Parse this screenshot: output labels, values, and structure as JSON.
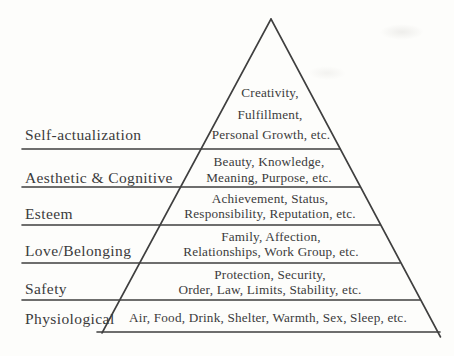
{
  "diagram": {
    "name": "Maslow hierarchy of needs pyramid",
    "ink_color": "#3b3b3b",
    "background_color": "#fdfdfb",
    "levels": [
      {
        "label": "Self-actualization",
        "lines": [
          "Creativity,",
          "Fulfillment,",
          "Personal Growth, etc."
        ]
      },
      {
        "label": "Aesthetic & Cognitive",
        "lines": [
          "Beauty, Knowledge,",
          "Meaning, Purpose, etc."
        ]
      },
      {
        "label": "Esteem",
        "lines": [
          "Achievement, Status,",
          "Responsibility, Reputation, etc."
        ]
      },
      {
        "label": "Love/Belonging",
        "lines": [
          "Family, Affection,",
          "Relationships, Work Group, etc."
        ]
      },
      {
        "label": "Safety",
        "lines": [
          "Protection, Security,",
          "Order, Law, Limits, Stability, etc."
        ]
      },
      {
        "label": "Physiological",
        "lines": [
          "Air, Food, Drink, Shelter, Warmth, Sex, Sleep, etc."
        ]
      }
    ]
  }
}
